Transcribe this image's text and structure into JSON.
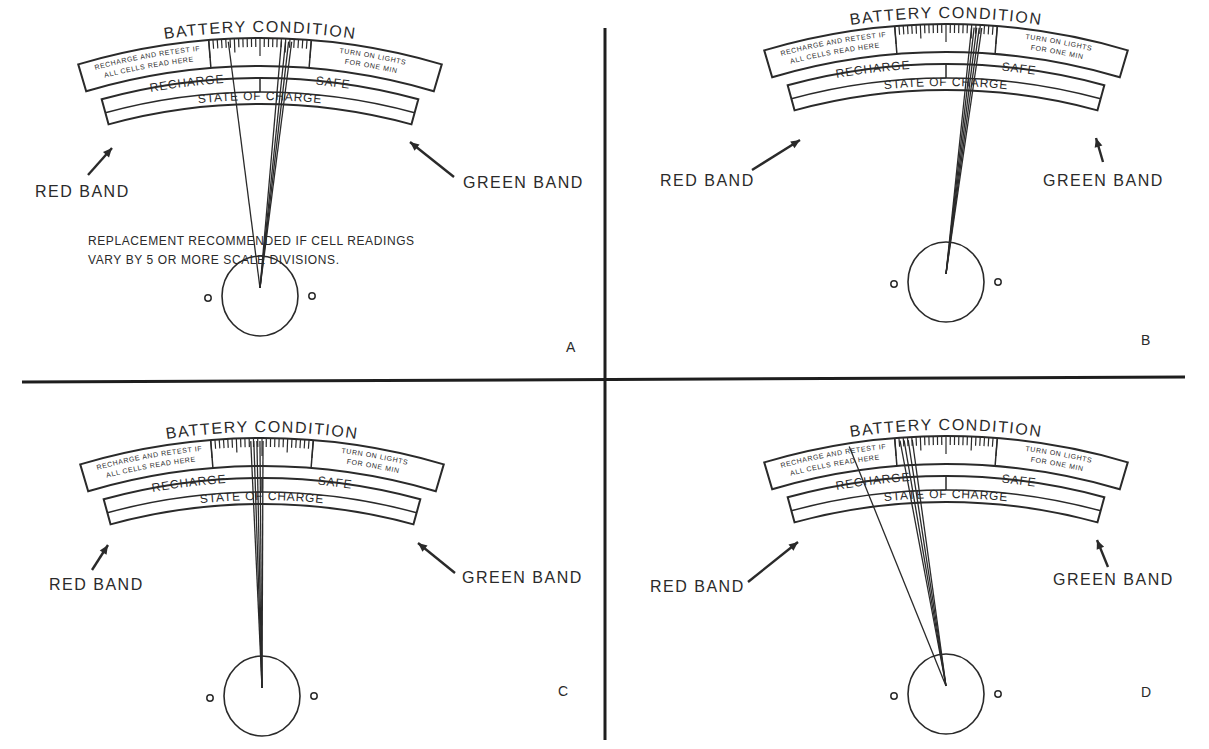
{
  "figure": {
    "panels": [
      {
        "id": "A",
        "letter": "A",
        "gauge_title": "BATTERY CONDITION",
        "left_window_text": [
          "RECHARGE AND RETEST IF",
          "ALL CELLS READ HERE"
        ],
        "right_window_text": [
          "TURN ON LIGHTS",
          "FOR ONE MIN"
        ],
        "recharge_label": "RECHARGE",
        "safe_label": "SAFE",
        "state_label": "STATE OF CHARGE",
        "red_band_label": "RED BAND",
        "green_band_label": "GREEN BAND",
        "note": [
          "REPLACEMENT RECOMMENDED IF CELL READINGS",
          "VARY BY 5 OR MORE SCALE DIVISIONS."
        ],
        "pointer_positions": [
          -0.62,
          0.42,
          0.5,
          0.56,
          0.62
        ]
      },
      {
        "id": "B",
        "letter": "B",
        "gauge_title": "BATTERY CONDITION",
        "left_window_text": [
          "RECHARGE AND RETEST IF",
          "ALL CELLS READ HERE"
        ],
        "right_window_text": [
          "TURN ON LIGHTS",
          "FOR ONE MIN"
        ],
        "recharge_label": "RECHARGE",
        "safe_label": "SAFE",
        "state_label": "STATE OF CHARGE",
        "red_band_label": "RED BAND",
        "green_band_label": "GREEN BAND",
        "note": [],
        "pointer_positions": [
          0.5,
          0.55,
          0.6,
          0.65,
          0.7
        ]
      },
      {
        "id": "C",
        "letter": "C",
        "gauge_title": "BATTERY CONDITION",
        "left_window_text": [
          "RECHARGE AND RETEST IF",
          "ALL CELLS READ HERE"
        ],
        "right_window_text": [
          "TURN ON LIGHTS",
          "FOR ONE MIN"
        ],
        "recharge_label": "RECHARGE",
        "safe_label": "SAFE",
        "state_label": "STATE OF CHARGE",
        "red_band_label": "RED BAND",
        "green_band_label": "GREEN BAND",
        "note": [],
        "pointer_positions": [
          -0.22,
          -0.16,
          -0.1,
          -0.04,
          0.02
        ]
      },
      {
        "id": "D",
        "letter": "D",
        "gauge_title": "BATTERY CONDITION",
        "left_window_text": [
          "RECHARGE AND RETEST IF",
          "ALL CELLS READ HERE"
        ],
        "right_window_text": [
          "TURN ON LIGHTS",
          "FOR ONE MIN"
        ],
        "recharge_label": "RECHARGE",
        "safe_label": "SAFE",
        "state_label": "STATE OF CHARGE",
        "red_band_label": "RED BAND",
        "green_band_label": "GREEN BAND",
        "note": [],
        "pointer_positions": [
          -1.9,
          -0.9,
          -0.82,
          -0.74,
          -0.66
        ]
      }
    ]
  },
  "colors": {
    "ink": "#2a2a2a",
    "background": "#ffffff",
    "divider": "#1e1e1e"
  }
}
